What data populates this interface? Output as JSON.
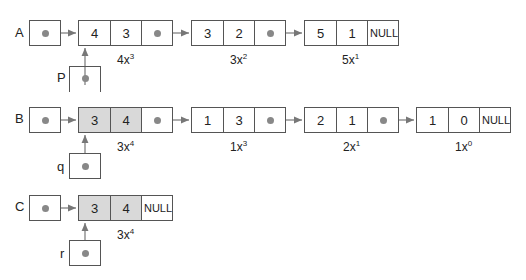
{
  "rows": {
    "A": {
      "label": "A",
      "nodes": [
        {
          "coef": "4",
          "exp": "3",
          "next": "",
          "term": "4x",
          "term_exp": "3"
        },
        {
          "coef": "3",
          "exp": "2",
          "next": "",
          "term": "3x",
          "term_exp": "2"
        },
        {
          "coef": "5",
          "exp": "1",
          "next": "NULL",
          "term": "5x",
          "term_exp": "1"
        }
      ],
      "pointer": {
        "label": "P"
      }
    },
    "B": {
      "label": "B",
      "nodes": [
        {
          "coef": "3",
          "exp": "4",
          "next": "",
          "term": "3x",
          "term_exp": "4"
        },
        {
          "coef": "1",
          "exp": "3",
          "next": "",
          "term": "1x",
          "term_exp": "3"
        },
        {
          "coef": "2",
          "exp": "1",
          "next": "",
          "term": "2x",
          "term_exp": "1"
        },
        {
          "coef": "1",
          "exp": "0",
          "next": "NULL",
          "term": "1x",
          "term_exp": "0"
        }
      ],
      "pointer": {
        "label": "q"
      }
    },
    "C": {
      "label": "C",
      "nodes": [
        {
          "coef": "3",
          "exp": "4",
          "next": "NULL",
          "term": "3x",
          "term_exp": "4"
        }
      ],
      "pointer": {
        "label": "r"
      }
    }
  },
  "colors": {
    "line": "#555555",
    "dot": "#888888",
    "shade": "#d9d9d9"
  }
}
